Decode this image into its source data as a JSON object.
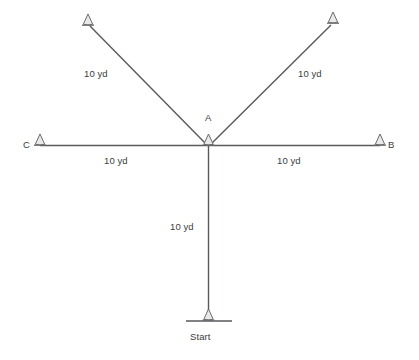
{
  "diagram": {
    "background_color": "#ffffff",
    "line_color": "#58595b",
    "cone_fill_color": "#e9e9ea",
    "cone_stroke_color": "#6a6b6d",
    "text_color": "#3c3c3e",
    "units": "yd",
    "nodes": [
      {
        "id": "start",
        "label": "Start",
        "x": 208,
        "y": 320,
        "has_cone": true,
        "has_base_line": true
      },
      {
        "id": "A",
        "label": "A",
        "x": 208,
        "y": 145,
        "has_cone": true,
        "has_base_line": false
      },
      {
        "id": "C",
        "label": "C",
        "x": 40,
        "y": 145,
        "has_cone": true,
        "has_base_line": false
      },
      {
        "id": "B",
        "label": "B",
        "x": 380,
        "y": 145,
        "has_cone": true,
        "has_base_line": false
      },
      {
        "id": "upper_left",
        "label": "",
        "x": 88,
        "y": 25,
        "has_cone": true,
        "has_base_line": false
      },
      {
        "id": "upper_right",
        "label": "",
        "x": 333,
        "y": 23,
        "has_cone": true,
        "has_base_line": false
      }
    ],
    "edges": [
      {
        "id": "start-to-A",
        "from": "start",
        "to": "A",
        "length_label": "10 yd"
      },
      {
        "id": "A-to-C",
        "from": "A",
        "to": "C",
        "length_label": "10 yd"
      },
      {
        "id": "A-to-B",
        "from": "A",
        "to": "B",
        "length_label": "10 yd"
      },
      {
        "id": "A-to-upper-left",
        "from": "A",
        "to": "upper_left",
        "length_label": "10 yd"
      },
      {
        "id": "A-to-upper-right",
        "from": "A",
        "to": "upper_right",
        "length_label": "10 yd"
      }
    ],
    "labels": {
      "start": "Start",
      "point_a": "A",
      "point_b": "B",
      "point_c": "C",
      "dist_upper_left": "10 yd",
      "dist_upper_right": "10 yd",
      "dist_left": "10 yd",
      "dist_right": "10 yd",
      "dist_vertical": "10 yd"
    }
  }
}
